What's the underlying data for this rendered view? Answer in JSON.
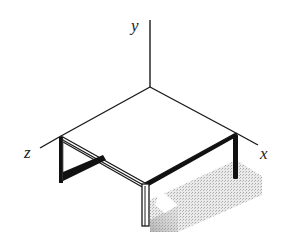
{
  "diagram": {
    "type": "isometric-table-with-axes",
    "axes": {
      "x": {
        "label": "x"
      },
      "y": {
        "label": "y"
      },
      "z": {
        "label": "z"
      }
    },
    "colors": {
      "line": "#1a1a1a",
      "top": "#ffffff",
      "shadow": "#c8c8c8"
    }
  }
}
